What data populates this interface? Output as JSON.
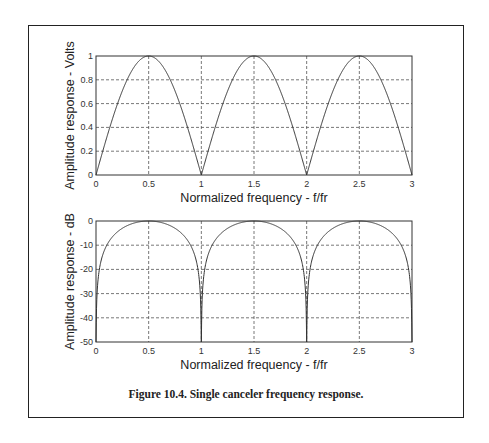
{
  "caption": "Figure 10.4. Single canceler frequency response.",
  "chart_data": [
    {
      "type": "line",
      "title": "",
      "xlabel": "Normalized frequency - f/fr",
      "ylabel": "Amplitude response - Volts",
      "xlim": [
        0,
        3
      ],
      "ylim": [
        0,
        1
      ],
      "xticks": [
        "0",
        "0.5",
        "1",
        "1.5",
        "2",
        "2.5",
        "3"
      ],
      "yticks": [
        "0",
        "0.2",
        "0.4",
        "0.6",
        "0.8",
        "1"
      ],
      "grid": true,
      "function": "|sin(pi * f/fr)|",
      "x": [
        0,
        0.25,
        0.5,
        0.75,
        1,
        1.25,
        1.5,
        1.75,
        2,
        2.25,
        2.5,
        2.75,
        3
      ],
      "values": [
        0,
        0.707,
        1,
        0.707,
        0,
        0.707,
        1,
        0.707,
        0,
        0.707,
        1,
        0.707,
        0
      ]
    },
    {
      "type": "line",
      "title": "",
      "xlabel": "Normalized frequency - f/fr",
      "ylabel": "Amplitude response - dB",
      "xlim": [
        0,
        3
      ],
      "ylim": [
        -50,
        0
      ],
      "xticks": [
        "0",
        "0.5",
        "1",
        "1.5",
        "2",
        "2.5",
        "3"
      ],
      "yticks": [
        "-50",
        "-40",
        "-30",
        "-20",
        "-10",
        "0"
      ],
      "grid": true,
      "function": "20*log10(|sin(pi * f/fr)|)",
      "x": [
        0,
        0.05,
        0.1,
        0.25,
        0.5,
        0.75,
        0.9,
        0.95,
        1,
        1.5,
        2,
        2.5,
        3
      ],
      "values": [
        -50,
        -16.1,
        -10.2,
        -3.0,
        0,
        -3.0,
        -10.2,
        -16.1,
        -50,
        0,
        -50,
        0,
        -50
      ]
    }
  ]
}
